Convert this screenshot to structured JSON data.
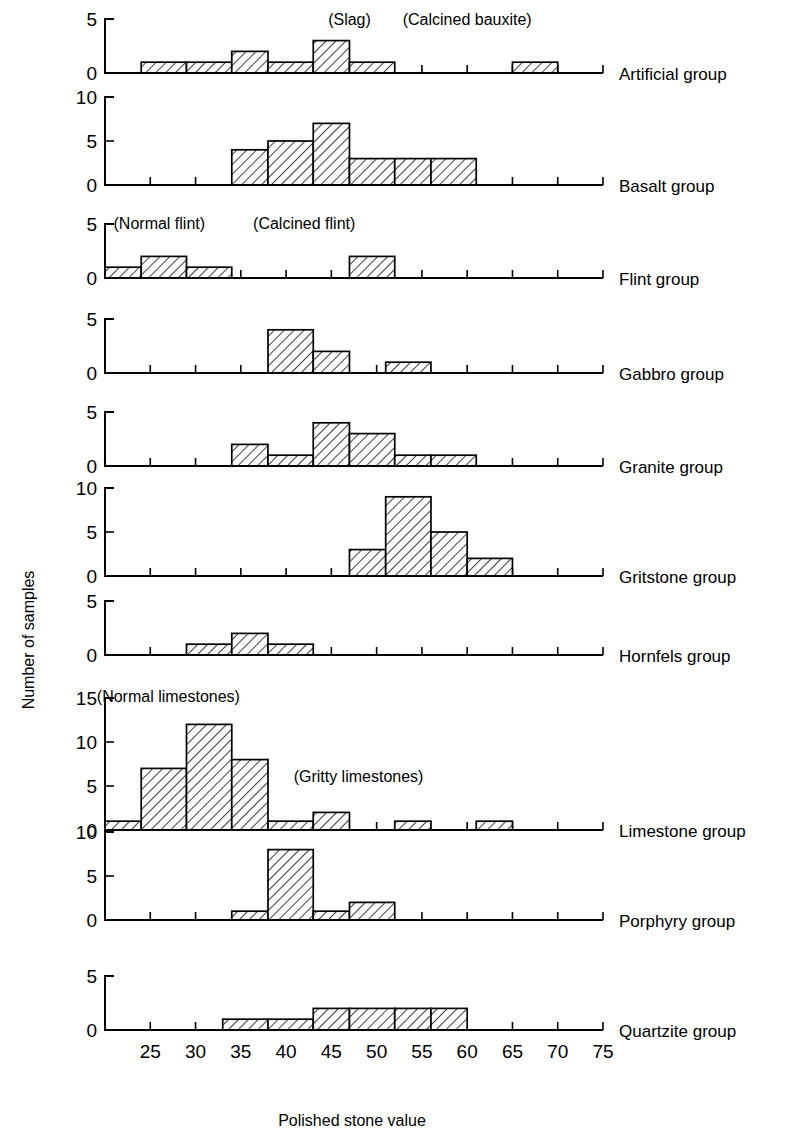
{
  "axis": {
    "x_title": "Polished stone value",
    "y_title": "Number of samples",
    "x_ticks": [
      25,
      30,
      35,
      40,
      45,
      50,
      55,
      60,
      65,
      70,
      75
    ],
    "x_min": 20,
    "x_max": 75
  },
  "annotations": [
    {
      "text": "(Slag)",
      "panel": "Artificial group"
    },
    {
      "text": "(Calcined bauxite)",
      "panel": "Artificial group"
    },
    {
      "text": "(Normal flint)",
      "panel": "Flint group"
    },
    {
      "text": "(Calcined flint)",
      "panel": "Flint group"
    },
    {
      "text": "(Normal limestones)",
      "panel": "Limestone group"
    },
    {
      "text": "(Gritty limestones)",
      "panel": "Limestone group"
    }
  ],
  "chart_data": {
    "type": "bar",
    "title": "",
    "xlabel": "Polished stone value",
    "ylabel": "Number of samples",
    "xlim": [
      20,
      75
    ],
    "grid": false,
    "legend": "none",
    "panels": [
      {
        "name": "Artificial group",
        "ylim": [
          0,
          5
        ],
        "yticks": [
          0,
          5
        ],
        "bins": [
          {
            "x0": 24,
            "x1": 29,
            "value": 1
          },
          {
            "x0": 29,
            "x1": 34,
            "value": 1
          },
          {
            "x0": 34,
            "x1": 38,
            "value": 2
          },
          {
            "x0": 38,
            "x1": 43,
            "value": 1
          },
          {
            "x0": 43,
            "x1": 47,
            "value": 3
          },
          {
            "x0": 47,
            "x1": 52,
            "value": 1
          },
          {
            "x0": 65,
            "x1": 70,
            "value": 1
          }
        ],
        "annotations": [
          {
            "text": "(Slag)",
            "x": 47,
            "y": 4.4
          },
          {
            "text": "(Calcined bauxite)",
            "x": 60,
            "y": 4.4
          }
        ]
      },
      {
        "name": "Basalt group",
        "ylim": [
          0,
          10
        ],
        "yticks": [
          0,
          5,
          10
        ],
        "bins": [
          {
            "x0": 34,
            "x1": 38,
            "value": 4
          },
          {
            "x0": 38,
            "x1": 43,
            "value": 5
          },
          {
            "x0": 43,
            "x1": 47,
            "value": 7
          },
          {
            "x0": 47,
            "x1": 52,
            "value": 3
          },
          {
            "x0": 52,
            "x1": 56,
            "value": 3
          },
          {
            "x0": 56,
            "x1": 61,
            "value": 3
          }
        ],
        "annotations": []
      },
      {
        "name": "Flint group",
        "ylim": [
          0,
          5
        ],
        "yticks": [
          0,
          5
        ],
        "bins": [
          {
            "x0": 20,
            "x1": 24,
            "value": 1
          },
          {
            "x0": 24,
            "x1": 29,
            "value": 2
          },
          {
            "x0": 29,
            "x1": 34,
            "value": 1
          },
          {
            "x0": 47,
            "x1": 52,
            "value": 2
          }
        ],
        "annotations": [
          {
            "text": "(Normal flint)",
            "x": 26,
            "y": 4.5
          },
          {
            "text": "(Calcined flint)",
            "x": 42,
            "y": 4.5
          }
        ]
      },
      {
        "name": "Gabbro group",
        "ylim": [
          0,
          5
        ],
        "yticks": [
          0,
          5
        ],
        "bins": [
          {
            "x0": 38,
            "x1": 43,
            "value": 4
          },
          {
            "x0": 43,
            "x1": 47,
            "value": 2
          },
          {
            "x0": 51,
            "x1": 56,
            "value": 1
          }
        ],
        "annotations": []
      },
      {
        "name": "Granite group",
        "ylim": [
          0,
          5
        ],
        "yticks": [
          0,
          5
        ],
        "bins": [
          {
            "x0": 34,
            "x1": 38,
            "value": 2
          },
          {
            "x0": 38,
            "x1": 43,
            "value": 1
          },
          {
            "x0": 43,
            "x1": 47,
            "value": 4
          },
          {
            "x0": 47,
            "x1": 52,
            "value": 3
          },
          {
            "x0": 52,
            "x1": 56,
            "value": 1
          },
          {
            "x0": 56,
            "x1": 61,
            "value": 1
          }
        ],
        "annotations": []
      },
      {
        "name": "Gritstone group",
        "ylim": [
          0,
          10
        ],
        "yticks": [
          0,
          5,
          10
        ],
        "bins": [
          {
            "x0": 47,
            "x1": 51,
            "value": 3
          },
          {
            "x0": 51,
            "x1": 56,
            "value": 9
          },
          {
            "x0": 56,
            "x1": 60,
            "value": 5
          },
          {
            "x0": 60,
            "x1": 65,
            "value": 2
          }
        ],
        "annotations": []
      },
      {
        "name": "Hornfels group",
        "ylim": [
          0,
          5
        ],
        "yticks": [
          0,
          5
        ],
        "bins": [
          {
            "x0": 29,
            "x1": 34,
            "value": 1
          },
          {
            "x0": 34,
            "x1": 38,
            "value": 2
          },
          {
            "x0": 38,
            "x1": 43,
            "value": 1
          }
        ],
        "annotations": []
      },
      {
        "name": "Limestone group",
        "ylim": [
          0,
          15
        ],
        "yticks": [
          0,
          5,
          10,
          15
        ],
        "bins": [
          {
            "x0": 20,
            "x1": 24,
            "value": 1
          },
          {
            "x0": 24,
            "x1": 29,
            "value": 7
          },
          {
            "x0": 29,
            "x1": 34,
            "value": 12
          },
          {
            "x0": 34,
            "x1": 38,
            "value": 8
          },
          {
            "x0": 38,
            "x1": 43,
            "value": 1
          },
          {
            "x0": 43,
            "x1": 47,
            "value": 2
          },
          {
            "x0": 52,
            "x1": 56,
            "value": 1
          },
          {
            "x0": 61,
            "x1": 65,
            "value": 1
          }
        ],
        "annotations": [
          {
            "text": "(Normal limestones)",
            "x": 27,
            "y": 14.5
          },
          {
            "text": "(Gritty limestones)",
            "x": 48,
            "y": 5.5
          }
        ]
      },
      {
        "name": "Porphyry group",
        "ylim": [
          0,
          10
        ],
        "yticks": [
          0,
          5,
          10
        ],
        "bins": [
          {
            "x0": 34,
            "x1": 38,
            "value": 1
          },
          {
            "x0": 38,
            "x1": 43,
            "value": 8
          },
          {
            "x0": 43,
            "x1": 47,
            "value": 1
          },
          {
            "x0": 47,
            "x1": 52,
            "value": 2
          }
        ],
        "annotations": []
      },
      {
        "name": "Quartzite group",
        "ylim": [
          0,
          5
        ],
        "yticks": [
          0,
          5
        ],
        "bins": [
          {
            "x0": 33,
            "x1": 38,
            "value": 1
          },
          {
            "x0": 38,
            "x1": 43,
            "value": 1
          },
          {
            "x0": 43,
            "x1": 47,
            "value": 2
          },
          {
            "x0": 47,
            "x1": 52,
            "value": 2
          },
          {
            "x0": 52,
            "x1": 56,
            "value": 2
          },
          {
            "x0": 56,
            "x1": 60,
            "value": 2
          }
        ],
        "annotations": []
      }
    ]
  }
}
